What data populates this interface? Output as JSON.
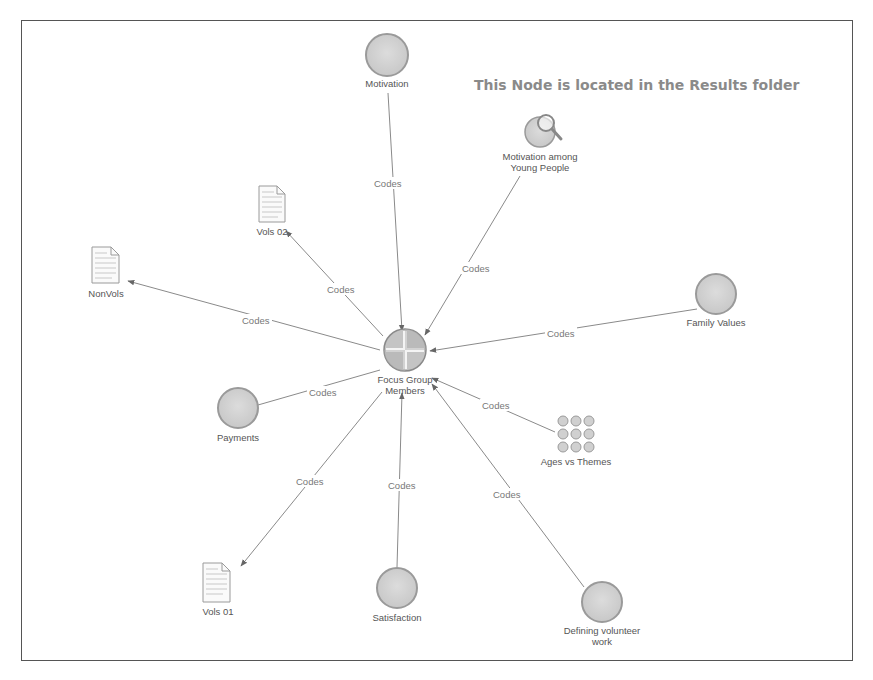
{
  "annotation": "This Node is located in the Results folder",
  "center": {
    "label_line1": "Focus Group",
    "label_line2": "Members",
    "x": 405,
    "y": 350
  },
  "edge_label": "Codes",
  "nodes": [
    {
      "id": "motivation",
      "type": "node",
      "label1": "Motivation",
      "label2": "",
      "x": 387,
      "y": 55
    },
    {
      "id": "motivation-young",
      "type": "query-result",
      "label1": "Motivation among",
      "label2": "Young People",
      "x": 540,
      "y": 130
    },
    {
      "id": "vols02",
      "type": "document",
      "label1": "Vols 02",
      "label2": "",
      "x": 266,
      "y": 206
    },
    {
      "id": "nonvols",
      "type": "document",
      "label1": "NonVols",
      "label2": "",
      "x": 104,
      "y": 267
    },
    {
      "id": "family-values",
      "type": "node",
      "label1": "Family Values",
      "label2": "",
      "x": 716,
      "y": 294
    },
    {
      "id": "payments",
      "type": "node",
      "label1": "Payments",
      "label2": "",
      "x": 238,
      "y": 408
    },
    {
      "id": "ages-themes",
      "type": "matrix",
      "label1": "Ages vs Themes",
      "label2": "",
      "x": 575,
      "y": 435
    },
    {
      "id": "vols01",
      "type": "document",
      "label1": "Vols 01",
      "label2": "",
      "x": 218,
      "y": 582
    },
    {
      "id": "satisfaction",
      "type": "node",
      "label1": "Satisfaction",
      "label2": "",
      "x": 397,
      "y": 588
    },
    {
      "id": "defining",
      "type": "node",
      "label1": "Defining volunteer",
      "label2": "work",
      "x": 602,
      "y": 602
    }
  ]
}
